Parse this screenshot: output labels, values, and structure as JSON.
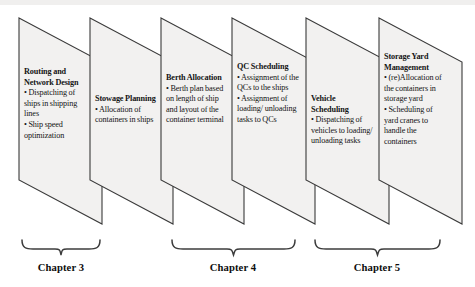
{
  "diagram": {
    "panel_fill": "#f2f1f0",
    "panel_stroke": "#3a3a3a",
    "brace_color": "#3c3c3c",
    "panels": [
      {
        "id": "routing-and-network-design",
        "title": "Routing and Network Design",
        "items": [
          "• Dispatching of ships in shipping lines",
          "• Ship speed optimization"
        ]
      },
      {
        "id": "stowage-planning",
        "title": "Stowage Planning",
        "items": [
          "• Allocation of containers in ships"
        ]
      },
      {
        "id": "berth-allocation",
        "title": "Berth Allocation",
        "items": [
          "• Berth plan based on length of ship and layout of the container terminal"
        ]
      },
      {
        "id": "qc-scheduling",
        "title": "QC Scheduling",
        "items": [
          "• Assignment of the QCs to the ships",
          "• Assignment of loading/ unloading tasks to QCs"
        ]
      },
      {
        "id": "vehicle-scheduling",
        "title": "Vehicle Scheduling",
        "items": [
          "• Dispatching of vehicles to loading/ unloading tasks"
        ]
      },
      {
        "id": "storage-yard-management",
        "title": "Storage Yard Management",
        "items": [
          "• (re)Allocation of the containers in storage yard",
          "• Scheduling of yard cranes to handle the containers"
        ]
      }
    ],
    "chapters": [
      {
        "id": "chapter-3",
        "label": "Chapter 3"
      },
      {
        "id": "chapter-4",
        "label": "Chapter 4"
      },
      {
        "id": "chapter-5",
        "label": "Chapter 5"
      }
    ]
  }
}
